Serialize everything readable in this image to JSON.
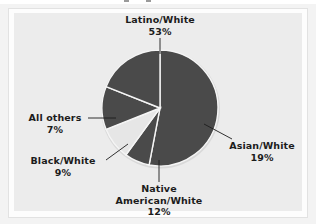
{
  "figure": {
    "background_color": "#ececec",
    "panel_color": "#fdfdfd",
    "slice_dark_color": "#4a4a4a",
    "slice_light_color": "#e6e6e6",
    "separator_color": "#ffffff",
    "leader_line_color": "#1c1c1c",
    "text_color": "#1c1c1c"
  },
  "chart_data": {
    "type": "pie",
    "title": "",
    "subtitle": "",
    "xlabel": "",
    "ylabel": "",
    "legend_position": "none",
    "grid": false,
    "labels": [
      "Latino/White",
      "Asian/White",
      "Native American/White",
      "Black/White",
      "All others"
    ],
    "values": [
      53,
      19,
      12,
      9,
      7
    ],
    "value_suffix": "%",
    "total": 100,
    "start_angle_deg": -90,
    "direction": "clockwise",
    "slices": [
      {
        "label": "Latino/White",
        "value": 53,
        "value_text": "53%",
        "color": "#4a4a4a",
        "label_lines": [
          "Latino/White",
          "53%"
        ]
      },
      {
        "label": "Asian/White",
        "value": 19,
        "value_text": "19%",
        "color": "#4a4a4a",
        "label_lines": [
          "Asian/White",
          "19%"
        ]
      },
      {
        "label": "Native American/White",
        "value": 12,
        "value_text": "12%",
        "color": "#4a4a4a",
        "label_lines": [
          "Native",
          "American/White",
          "12%"
        ]
      },
      {
        "label": "Black/White",
        "value": 9,
        "value_text": "9%",
        "color": "#e6e6e6",
        "label_lines": [
          "Black/White",
          "9%"
        ]
      },
      {
        "label": "All others",
        "value": 7,
        "value_text": "7%",
        "color": "#4a4a4a",
        "label_lines": [
          "All others",
          "7%"
        ]
      }
    ]
  },
  "callouts": {
    "latino": {
      "name": "Latino/White",
      "pct": "53%"
    },
    "asian": {
      "name": "Asian/White",
      "pct": "19%"
    },
    "native": {
      "name_line1": "Native",
      "name_line2": "American/White",
      "pct": "12%"
    },
    "black": {
      "name": "Black/White",
      "pct": "9%"
    },
    "others": {
      "name": "All others",
      "pct": "7%"
    }
  }
}
